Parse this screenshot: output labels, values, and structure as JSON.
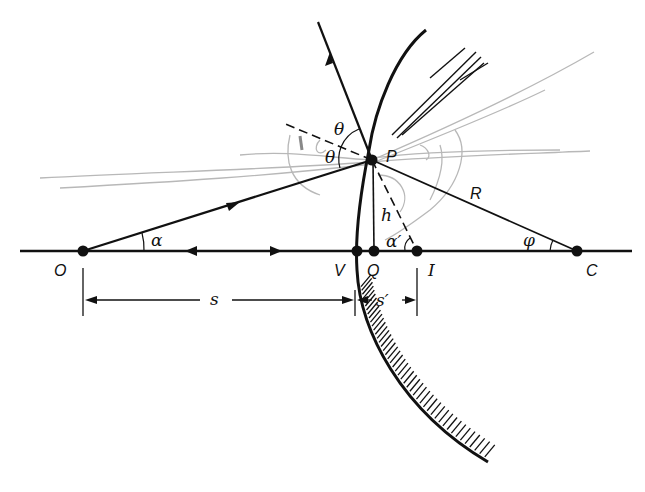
{
  "diagram": {
    "points": {
      "O": {
        "label": "O",
        "x": 83,
        "y": 251
      },
      "V": {
        "label": "V",
        "x": 357,
        "y": 251
      },
      "Q": {
        "label": "Q",
        "x": 374,
        "y": 251
      },
      "I": {
        "label": "I",
        "x": 417,
        "y": 251
      },
      "C": {
        "label": "C",
        "x": 577,
        "y": 251
      },
      "P": {
        "label": "P",
        "x": 372,
        "y": 160
      }
    },
    "angles": {
      "alpha": "α",
      "alpha_prime": "α′",
      "theta_incident": "θ",
      "theta_reflected": "θ",
      "phi": "φ"
    },
    "segments": {
      "radius": "R",
      "height": "h"
    },
    "dimensions": {
      "object_distance": "s",
      "image_distance": "s′"
    },
    "colors": {
      "ink": "#111111",
      "pencil": "#b8b8b8",
      "background": "#ffffff"
    }
  }
}
